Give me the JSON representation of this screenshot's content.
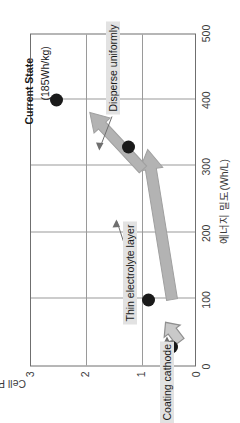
{
  "chart_data": {
    "type": "scatter",
    "title": "",
    "xlabel": "에너지 밀도(Wh/L)",
    "ylabel": "Cell Power Density (kW/L)",
    "xlim": [
      0,
      500
    ],
    "ylim": [
      0,
      3
    ],
    "xticks": [
      0,
      100,
      200,
      300,
      400,
      500
    ],
    "yticks": [
      0,
      1,
      2,
      3
    ],
    "xtick_labels": [
      "0",
      "100",
      "200",
      "300",
      "400",
      "500"
    ],
    "ytick_labels": [
      "0",
      "1",
      "2",
      "3"
    ],
    "grid": true,
    "legend": "none",
    "points": [
      {
        "name": "start-point",
        "x": 30,
        "y": 0.45
      },
      {
        "name": "coated-cathode-point",
        "x": 100,
        "y": 0.85
      },
      {
        "name": "thin-electrolyte-point",
        "x": 330,
        "y": 1.22
      },
      {
        "name": "current-state-point",
        "x": 400,
        "y": 2.52
      }
    ],
    "annotations": [
      {
        "name": "current-state",
        "text": "Current State",
        "bold": true
      },
      {
        "name": "current-state-value",
        "text": "(185Wh/kg)"
      },
      {
        "name": "coating-cathode",
        "text": "Coating cathode"
      },
      {
        "name": "thin-electrolyte-layer",
        "text": "Thin electrolyte layer"
      },
      {
        "name": "disperse-uniformly",
        "text": "Disperse uniformly"
      }
    ],
    "arrows": [
      {
        "name": "coating-cathode-arrow",
        "from": [
          30,
          0.45
        ],
        "to": [
          100,
          0.85
        ]
      },
      {
        "name": "thin-electrolyte-arrow",
        "from": [
          100,
          0.85
        ],
        "to": [
          330,
          1.22
        ]
      },
      {
        "name": "disperse-uniformly-arrow",
        "from": [
          330,
          1.22
        ],
        "to": [
          400,
          2.52
        ]
      }
    ]
  },
  "colors": {
    "point": "#1a1a1a",
    "arrow_fill": "#b3b3b3",
    "arrow_stroke": "#8c8c8c",
    "grid": "#9a9a9a",
    "frame": "#6f6f6f",
    "label_bg": "#e2e2e2",
    "text": "#1a1a1a",
    "axis_text": "#3b3b3b",
    "background": "#ffffff"
  }
}
